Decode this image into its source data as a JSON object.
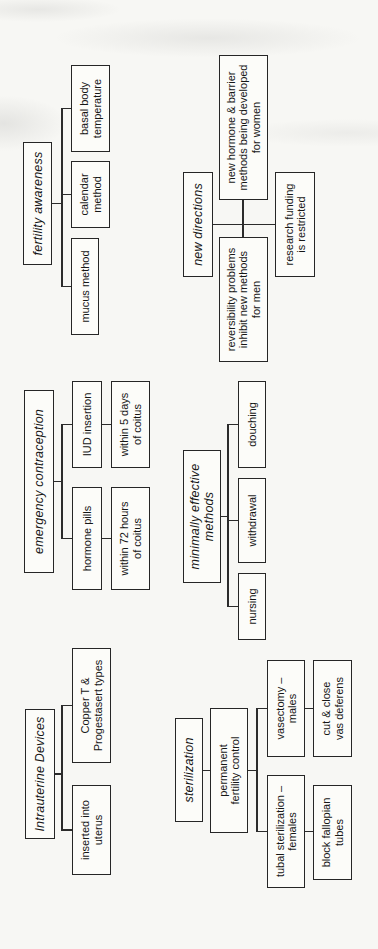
{
  "document": {
    "type": "scanned-hierarchy-diagram",
    "subject": "contraception methods",
    "orientation": "rotated-90-ccw"
  },
  "colors": {
    "ink": "#262626",
    "paper": "#f7f7f4",
    "box_fill": "#fcfcf9"
  },
  "diagram": {
    "clusters": [
      {
        "name": "intrauterine-devices",
        "heading": {
          "label": "Intrauterine Devices"
        },
        "children": [
          {
            "label": "inserted into\nuterus"
          },
          {
            "label": "Copper T &\nProgestasert types"
          }
        ]
      },
      {
        "name": "emergency-contraception",
        "heading": {
          "label": "emergency contraception"
        },
        "children": [
          {
            "label": "hormone pills",
            "detail": {
              "label": "within 72 hours\nof coitus"
            }
          },
          {
            "label": "IUD insertion",
            "detail": {
              "label": "within 5 days\nof coitus"
            }
          }
        ]
      },
      {
        "name": "fertility-awareness",
        "heading": {
          "label": "fertility awareness"
        },
        "children": [
          {
            "label": "mucus method"
          },
          {
            "label": "calendar\nmethod"
          },
          {
            "label": "basal body\ntemperature"
          }
        ]
      },
      {
        "name": "sterilization",
        "heading": {
          "label": "sterilization"
        },
        "subheading": {
          "label": "permanent\nfertility control"
        },
        "children": [
          {
            "label": "tubal sterilization –\nfemales",
            "detail": {
              "label": "block fallopian\ntubes"
            }
          },
          {
            "label": "vasectomy –\nmales",
            "detail": {
              "label": "cut & close\nvas deferens"
            }
          }
        ]
      },
      {
        "name": "minimally-effective-methods",
        "heading": {
          "label": "minimally effective\nmethods"
        },
        "children": [
          {
            "label": "nursing"
          },
          {
            "label": "withdrawal"
          },
          {
            "label": "douching"
          }
        ]
      },
      {
        "name": "new-directions",
        "heading": {
          "label": "new directions"
        },
        "children": [
          {
            "label": "reversibility problems\ninhibit new methods\nfor men"
          },
          {
            "label": "new hormone & barrier\nmethods being developed\nfor women"
          },
          {
            "label": "research funding\nis restricted"
          }
        ]
      }
    ]
  }
}
